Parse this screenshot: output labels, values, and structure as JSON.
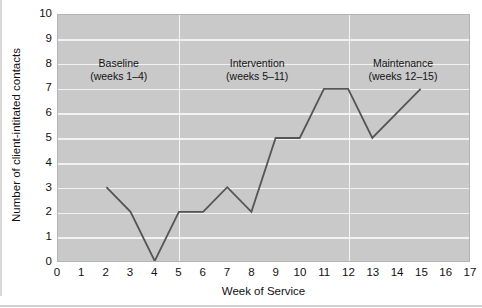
{
  "chart_data": {
    "type": "line",
    "title": "",
    "xlabel": "Week of Service",
    "ylabel": "Number of client-intitated contacts",
    "xlim": [
      0,
      17
    ],
    "ylim": [
      0,
      10
    ],
    "grid": true,
    "legend": "none",
    "x": [
      2,
      3,
      4,
      5,
      6,
      7,
      8,
      9,
      10,
      11,
      12,
      13,
      14,
      15
    ],
    "values": [
      3,
      2,
      0,
      2,
      2,
      3,
      2,
      5,
      5,
      7,
      7,
      5,
      6,
      7
    ],
    "series": [
      {
        "name": "Client-initiated contacts",
        "x": [
          2,
          3,
          4,
          5,
          6,
          7,
          8,
          9,
          10,
          11,
          12,
          13,
          14,
          15
        ],
        "values": [
          3,
          2,
          0,
          2,
          2,
          3,
          2,
          5,
          5,
          7,
          7,
          5,
          6,
          7
        ],
        "color": "#555555"
      }
    ],
    "xticks": [
      "0",
      "1",
      "2",
      "3",
      "4",
      "5",
      "6",
      "7",
      "8",
      "9",
      "10",
      "11",
      "12",
      "13",
      "14",
      "15",
      "16",
      "17"
    ],
    "yticks": [
      "0",
      "1",
      "2",
      "3",
      "4",
      "5",
      "6",
      "7",
      "8",
      "9",
      "10"
    ],
    "phase_dividers": [
      5,
      12
    ],
    "annotations": [
      {
        "line1": "Baseline",
        "line2": "(weeks 1–4)",
        "center_week": 2.5,
        "value": 8
      },
      {
        "line1": "Intervention",
        "line2": "(weeks 5–11)",
        "center_week": 8.2,
        "value": 8
      },
      {
        "line1": "Maintenance",
        "line2": "(weeks 12–15)",
        "center_week": 14.2,
        "value": 8
      }
    ],
    "colors": {
      "plot_background": "#c9c9c9",
      "gridline": "#f2f2f2",
      "divider": "#f4f4f4",
      "line": "#555555",
      "text": "#111111",
      "page_background": "#ffffff"
    }
  }
}
